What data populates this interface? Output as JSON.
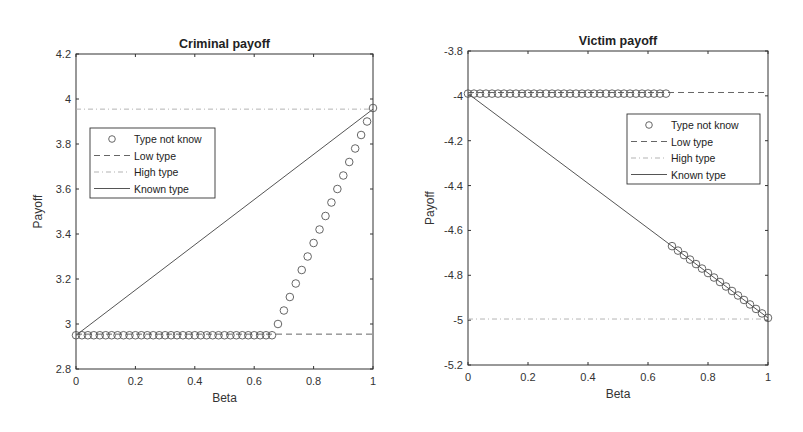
{
  "chart_data": [
    {
      "type": "line",
      "title": "Criminal payoff",
      "xlabel": "Beta",
      "ylabel": "Payoff",
      "xlim": [
        0,
        1
      ],
      "ylim": [
        2.8,
        4.2
      ],
      "xticks": [
        "0",
        "0.2",
        "0.4",
        "0.6",
        "0.8",
        "1"
      ],
      "yticks": [
        "2.8",
        "3",
        "3.2",
        "3.4",
        "3.6",
        "3.8",
        "4",
        "4.2"
      ],
      "grid": false,
      "legend_position": "upper-left",
      "legend": [
        "Type not know",
        "Low type",
        "High type",
        "Known type"
      ],
      "series": [
        {
          "name": "Type not know",
          "style": "circle-markers",
          "x": [
            0,
            0.02,
            0.04,
            0.06,
            0.08,
            0.1,
            0.12,
            0.14,
            0.16,
            0.18,
            0.2,
            0.22,
            0.24,
            0.26,
            0.28,
            0.3,
            0.32,
            0.34,
            0.36,
            0.38,
            0.4,
            0.42,
            0.44,
            0.46,
            0.48,
            0.5,
            0.52,
            0.54,
            0.56,
            0.58,
            0.6,
            0.62,
            0.64,
            0.66,
            0.68,
            0.7,
            0.72,
            0.74,
            0.76,
            0.78,
            0.8,
            0.82,
            0.84,
            0.86,
            0.88,
            0.9,
            0.92,
            0.94,
            0.96,
            0.98,
            1
          ],
          "y": [
            2.95,
            2.95,
            2.95,
            2.95,
            2.95,
            2.95,
            2.95,
            2.95,
            2.95,
            2.95,
            2.95,
            2.95,
            2.95,
            2.95,
            2.95,
            2.95,
            2.95,
            2.95,
            2.95,
            2.95,
            2.95,
            2.95,
            2.95,
            2.95,
            2.95,
            2.95,
            2.95,
            2.95,
            2.95,
            2.95,
            2.95,
            2.95,
            2.95,
            2.95,
            3.0,
            3.06,
            3.12,
            3.18,
            3.24,
            3.3,
            3.36,
            3.42,
            3.48,
            3.54,
            3.6,
            3.66,
            3.72,
            3.78,
            3.84,
            3.9,
            3.96
          ]
        },
        {
          "name": "Low type",
          "style": "dashed",
          "x": [
            0,
            1
          ],
          "y": [
            2.955,
            2.955
          ]
        },
        {
          "name": "High type",
          "style": "dash-dot",
          "x": [
            0,
            1
          ],
          "y": [
            3.955,
            3.955
          ]
        },
        {
          "name": "Known type",
          "style": "solid",
          "x": [
            0,
            1
          ],
          "y": [
            2.95,
            3.955
          ]
        }
      ]
    },
    {
      "type": "line",
      "title": "Victim payoff",
      "xlabel": "Beta",
      "ylabel": "Payoff",
      "xlim": [
        0,
        1
      ],
      "ylim": [
        -5.2,
        -3.8
      ],
      "xticks": [
        "0",
        "0.2",
        "0.4",
        "0.6",
        "0.8",
        "1"
      ],
      "yticks": [
        "-5.2",
        "-5",
        "-4.8",
        "-4.6",
        "-4.4",
        "-4.2",
        "-4",
        "-3.8"
      ],
      "grid": false,
      "legend_position": "upper-right",
      "legend": [
        "Type not know",
        "Low type",
        "High type",
        "Known type"
      ],
      "series": [
        {
          "name": "Type not know",
          "style": "circle-markers",
          "x": [
            0,
            0.02,
            0.04,
            0.06,
            0.08,
            0.1,
            0.12,
            0.14,
            0.16,
            0.18,
            0.2,
            0.22,
            0.24,
            0.26,
            0.28,
            0.3,
            0.32,
            0.34,
            0.36,
            0.38,
            0.4,
            0.42,
            0.44,
            0.46,
            0.48,
            0.5,
            0.52,
            0.54,
            0.56,
            0.58,
            0.6,
            0.62,
            0.64,
            0.66,
            0.68,
            0.7,
            0.72,
            0.74,
            0.76,
            0.78,
            0.8,
            0.82,
            0.84,
            0.86,
            0.88,
            0.9,
            0.92,
            0.94,
            0.96,
            0.98,
            1
          ],
          "y": [
            -3.99,
            -3.99,
            -3.99,
            -3.99,
            -3.99,
            -3.99,
            -3.99,
            -3.99,
            -3.99,
            -3.99,
            -3.99,
            -3.99,
            -3.99,
            -3.99,
            -3.99,
            -3.99,
            -3.99,
            -3.99,
            -3.99,
            -3.99,
            -3.99,
            -3.99,
            -3.99,
            -3.99,
            -3.99,
            -3.99,
            -3.99,
            -3.99,
            -3.99,
            -3.99,
            -3.99,
            -3.99,
            -3.99,
            -3.99,
            -4.67,
            -4.69,
            -4.71,
            -4.73,
            -4.75,
            -4.77,
            -4.79,
            -4.81,
            -4.83,
            -4.85,
            -4.87,
            -4.89,
            -4.91,
            -4.93,
            -4.95,
            -4.97,
            -4.99
          ]
        },
        {
          "name": "Low type",
          "style": "dashed",
          "x": [
            0,
            1
          ],
          "y": [
            -3.985,
            -3.985
          ]
        },
        {
          "name": "High type",
          "style": "dash-dot",
          "x": [
            0,
            1
          ],
          "y": [
            -4.995,
            -4.995
          ]
        },
        {
          "name": "Known type",
          "style": "solid",
          "x": [
            0,
            1
          ],
          "y": [
            -3.99,
            -4.99
          ]
        }
      ]
    }
  ],
  "charts": {
    "left": {
      "title": "Criminal payoff",
      "xlabel": "Beta",
      "ylabel": "Payoff"
    },
    "right": {
      "title": "Victim payoff",
      "xlabel": "Beta",
      "ylabel": "Payoff"
    }
  },
  "legend_labels": [
    "Type not know",
    "Low type",
    "High type",
    "Known type"
  ]
}
